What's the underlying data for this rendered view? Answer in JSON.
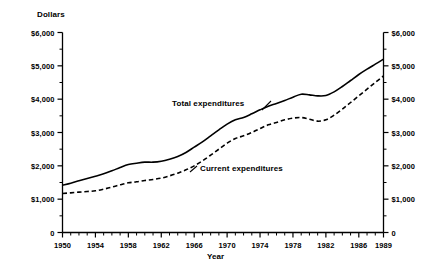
{
  "chart_data": {
    "type": "line",
    "title": "",
    "xlabel": "Year",
    "ylabel": "Dollars",
    "xlim": [
      1950,
      1989
    ],
    "ylim": [
      0,
      6000
    ],
    "grid": false,
    "legend_position": "inline-annotations",
    "y_tick_labels": [
      "$6,000",
      "$5,000",
      "$4,000",
      "$3,000",
      "$2,000",
      "$1,000",
      "0"
    ],
    "y_ticks": [
      6000,
      5000,
      4000,
      3000,
      2000,
      1000,
      0
    ],
    "y_minor_ticks": [
      5500,
      4500,
      3500,
      2500,
      1500,
      500
    ],
    "x_tick_labels": [
      "1950",
      "1954",
      "1958",
      "1962",
      "1966",
      "1970",
      "1974",
      "1978",
      "1982",
      "1986",
      "1989"
    ],
    "x_major_ticks": [
      1950,
      1954,
      1958,
      1962,
      1966,
      1970,
      1974,
      1978,
      1982,
      1986,
      1989
    ],
    "x": [
      1950,
      1951,
      1952,
      1953,
      1954,
      1955,
      1956,
      1957,
      1958,
      1959,
      1960,
      1961,
      1962,
      1963,
      1964,
      1965,
      1966,
      1967,
      1968,
      1969,
      1970,
      1971,
      1972,
      1973,
      1974,
      1975,
      1976,
      1977,
      1978,
      1979,
      1980,
      1981,
      1982,
      1983,
      1984,
      1985,
      1986,
      1987,
      1988,
      1989
    ],
    "series": [
      {
        "name": "Total expenditures",
        "style": "solid",
        "color": "#000000",
        "values": [
          1420,
          1480,
          1550,
          1620,
          1690,
          1760,
          1850,
          1950,
          2040,
          2080,
          2110,
          2110,
          2140,
          2200,
          2280,
          2400,
          2560,
          2720,
          2900,
          3080,
          3250,
          3380,
          3450,
          3560,
          3680,
          3790,
          3870,
          3960,
          4060,
          4150,
          4130,
          4100,
          4110,
          4220,
          4380,
          4560,
          4740,
          4900,
          5050,
          5200
        ]
      },
      {
        "name": "Current expenditures",
        "style": "dashed",
        "color": "#000000",
        "values": [
          1170,
          1190,
          1210,
          1230,
          1250,
          1300,
          1360,
          1430,
          1490,
          1520,
          1560,
          1590,
          1630,
          1700,
          1780,
          1880,
          2000,
          2150,
          2320,
          2500,
          2680,
          2820,
          2900,
          3000,
          3120,
          3230,
          3300,
          3380,
          3430,
          3450,
          3400,
          3340,
          3380,
          3520,
          3700,
          3900,
          4100,
          4300,
          4500,
          4700
        ]
      }
    ],
    "annotations": [
      {
        "text": "Total expenditures",
        "x": 1963,
        "y": 3450
      },
      {
        "text": "Current expenditures",
        "x": 1967,
        "y": 1500
      }
    ]
  }
}
